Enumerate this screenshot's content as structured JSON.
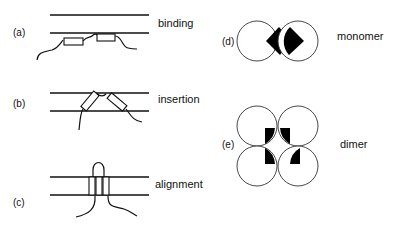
{
  "panels": {
    "a": {
      "tag": "(a)",
      "label": "binding"
    },
    "b": {
      "tag": "(b)",
      "label": "insertion"
    },
    "c": {
      "tag": "(c)",
      "label": "alignment"
    },
    "d": {
      "tag": "(d)",
      "label": "monomer"
    },
    "e": {
      "tag": "(e)",
      "label": "dimer"
    }
  },
  "colors": {
    "ink": "#111111",
    "background": "#ffffff",
    "fill": "#000000"
  }
}
